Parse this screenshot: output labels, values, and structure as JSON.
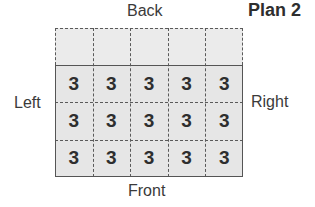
{
  "title": "Plan 2",
  "labels": {
    "back": "Back",
    "front": "Front",
    "left": "Left",
    "right": "Right"
  },
  "grid": {
    "columns": 5,
    "rows": 4,
    "back_row_empty": true,
    "values": [
      [
        "",
        "",
        "",
        "",
        ""
      ],
      [
        "3",
        "3",
        "3",
        "3",
        "3"
      ],
      [
        "3",
        "3",
        "3",
        "3",
        "3"
      ],
      [
        "3",
        "3",
        "3",
        "3",
        "3"
      ]
    ]
  },
  "colors": {
    "cell_fill": "#e6e6e6",
    "line": "#555555",
    "text": "#2e2e2e"
  }
}
